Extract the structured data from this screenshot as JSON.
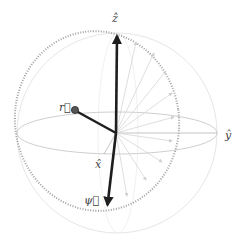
{
  "diagram": {
    "type": "bloch-sphere",
    "origin": [
      116,
      133
    ],
    "colors": {
      "sphere_outline": "#e4e4e4",
      "equator": "#c8c8c8",
      "dotted_arc": "#9a9a9a",
      "main_vector": "#1e1e1e",
      "ghost_vector": "#d4d4d4",
      "axis_line": "#bdbdbd",
      "label": "#444444"
    },
    "axes": {
      "z": {
        "label": "ẑ",
        "end": [
          117,
          33
        ]
      },
      "x": {
        "label": "x̂",
        "end": [
          104,
          154
        ]
      },
      "y": {
        "label": "ŷ",
        "end": [
          217,
          133
        ]
      }
    },
    "vectors": {
      "r": {
        "label": "r⃗",
        "end": [
          74,
          110
        ]
      },
      "psi": {
        "label": "ψ⃗",
        "end": [
          107,
          208
        ]
      }
    },
    "ghost_vector_count": 9
  }
}
